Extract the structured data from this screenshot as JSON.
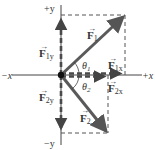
{
  "diagram": {
    "type": "vector-components",
    "colors": {
      "axis": "#444444",
      "vector": "#5a5a5a",
      "dashed": "#555555",
      "text": "#333333",
      "background": "#ffffff"
    },
    "axes": {
      "pos_y": "+y",
      "neg_y": "−y",
      "pos_x": "+x",
      "neg_x": "−x"
    },
    "vectors": [
      {
        "name": "F",
        "sub": "1",
        "label": "F1"
      },
      {
        "name": "F",
        "sub": "2",
        "label": "F2"
      }
    ],
    "components": [
      {
        "name": "F",
        "sub": "1y"
      },
      {
        "name": "F",
        "sub": "1x"
      },
      {
        "name": "F",
        "sub": "2x"
      },
      {
        "name": "F",
        "sub": "2y"
      }
    ],
    "angles": [
      {
        "symbol": "θ",
        "sub": "1"
      },
      {
        "symbol": "θ",
        "sub": "2"
      }
    ]
  }
}
